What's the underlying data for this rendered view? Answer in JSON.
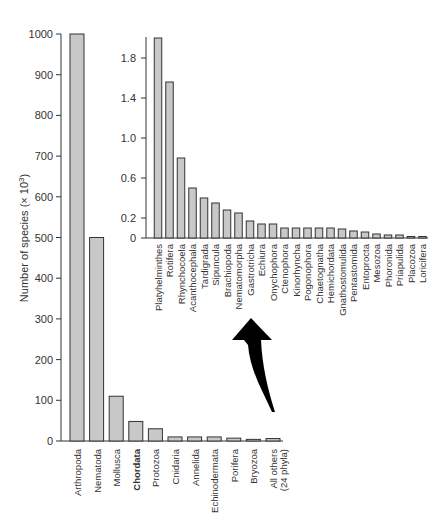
{
  "chart_data": [
    {
      "type": "bar",
      "title": "",
      "xlabel": "",
      "ylabel": "Number of species (× 10³)",
      "ylim": [
        0,
        1000
      ],
      "yticks": [
        0,
        100,
        200,
        300,
        400,
        500,
        600,
        700,
        800,
        900,
        1000
      ],
      "categories": [
        "Arthropoda",
        "Nematoda",
        "Mollusca",
        "Chordata",
        "Protozoa",
        "Cnidaria",
        "Annelida",
        "Echinodermata",
        "Porifera",
        "Bryozoa",
        "All others (24 phyla)"
      ],
      "values": [
        1000,
        500,
        110,
        48,
        30,
        10,
        10,
        10,
        7,
        4,
        6
      ],
      "highlighted_category": "Chordata",
      "grid": false
    },
    {
      "type": "bar",
      "title": "Inset: All others (24 phyla)",
      "xlabel": "",
      "ylabel": "",
      "ylim": [
        0,
        2.0
      ],
      "yticks": [
        0,
        0.2,
        0.6,
        1.0,
        1.4,
        1.8
      ],
      "categories": [
        "Platyhelminthes",
        "Rotifera",
        "Rhynchocoela",
        "Acanthocephala",
        "Tardigrada",
        "Sipuncula",
        "Brachiopoda",
        "Nematomorpha",
        "Gastrotricha",
        "Echiura",
        "Onychophora",
        "Ctenophora",
        "Kinorhyncha",
        "Pogonophora",
        "Chaetognatha",
        "Hemichordata",
        "Gnathostomulida",
        "Pentastomida",
        "Entoprocta",
        "Mesozoa",
        "Phoronida",
        "Priapulida",
        "Placozoa",
        "Loricifera"
      ],
      "values": [
        2.0,
        1.56,
        0.8,
        0.5,
        0.4,
        0.35,
        0.28,
        0.25,
        0.17,
        0.14,
        0.14,
        0.1,
        0.1,
        0.1,
        0.1,
        0.1,
        0.09,
        0.07,
        0.06,
        0.04,
        0.03,
        0.03,
        0.01,
        0.01
      ],
      "grid": false
    }
  ],
  "main": {
    "ylabel": "Number of species (× 10",
    "ylabel_sup": "3",
    "ylabel_end": ")",
    "yticks": [
      "0",
      "100",
      "200",
      "300",
      "400",
      "500",
      "600",
      "700",
      "800",
      "900",
      "1000"
    ],
    "bars": [
      {
        "label": "Arthropoda",
        "value": 1000
      },
      {
        "label": "Nematoda",
        "value": 500
      },
      {
        "label": "Mollusca",
        "value": 110
      },
      {
        "label": "Chordata",
        "value": 48,
        "bold": true
      },
      {
        "label": "Protozoa",
        "value": 30
      },
      {
        "label": "Cnidaria",
        "value": 10
      },
      {
        "label": "Annelida",
        "value": 10
      },
      {
        "label": "Echinodermata",
        "value": 10
      },
      {
        "label": "Porifera",
        "value": 7
      },
      {
        "label": "Bryozoa",
        "value": 4
      },
      {
        "label": "All others",
        "label2": "(24 phyla)",
        "value": 6
      }
    ]
  },
  "inset": {
    "yticks": [
      "0",
      "0.2",
      "0.6",
      "1.0",
      "1.4",
      "1.8"
    ],
    "bars": [
      {
        "label": "Platyhelminthes",
        "value": 2.0
      },
      {
        "label": "Rotifera",
        "value": 1.56
      },
      {
        "label": "Rhynchocoela",
        "value": 0.8
      },
      {
        "label": "Acanthocephala",
        "value": 0.5
      },
      {
        "label": "Tardigrada",
        "value": 0.4
      },
      {
        "label": "Sipuncula",
        "value": 0.35
      },
      {
        "label": "Brachiopoda",
        "value": 0.28
      },
      {
        "label": "Nematomorpha",
        "value": 0.25
      },
      {
        "label": "Gastrotricha",
        "value": 0.17
      },
      {
        "label": "Echiura",
        "value": 0.14
      },
      {
        "label": "Onychophora",
        "value": 0.14
      },
      {
        "label": "Ctenophora",
        "value": 0.1
      },
      {
        "label": "Kinorhyncha",
        "value": 0.1
      },
      {
        "label": "Pogonophora",
        "value": 0.1
      },
      {
        "label": "Chaetognatha",
        "value": 0.1
      },
      {
        "label": "Hemichordata",
        "value": 0.1
      },
      {
        "label": "Gnathostomulida",
        "value": 0.09
      },
      {
        "label": "Pentastomida",
        "value": 0.07
      },
      {
        "label": "Entoprocta",
        "value": 0.06
      },
      {
        "label": "Mesozoa",
        "value": 0.04
      },
      {
        "label": "Phoronida",
        "value": 0.03
      },
      {
        "label": "Priapulida",
        "value": 0.03
      },
      {
        "label": "Placozoa",
        "value": 0.01
      },
      {
        "label": "Loricifera",
        "value": 0.01
      }
    ]
  },
  "colors": {
    "bar_fill": "#c8c8c8",
    "bar_stroke": "#333333",
    "arrow": "#000000",
    "axis": "#333333"
  }
}
